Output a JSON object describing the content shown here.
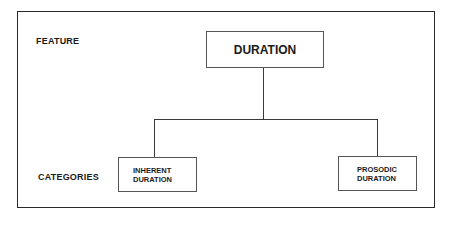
{
  "diagram": {
    "type": "hierarchy",
    "levels": {
      "feature_label": "FEATURE",
      "categories_label": "CATEGORIES"
    },
    "root": {
      "label": "DURATION"
    },
    "children": [
      {
        "line1": "INHERENT",
        "line2": "DURATION"
      },
      {
        "line1": "PROSODIC",
        "line2": "DURATION"
      }
    ],
    "colors": {
      "line": "#3a3a3a",
      "frame": "#2a2a2a",
      "text": "#1a1a1a",
      "background": "#ffffff"
    }
  }
}
